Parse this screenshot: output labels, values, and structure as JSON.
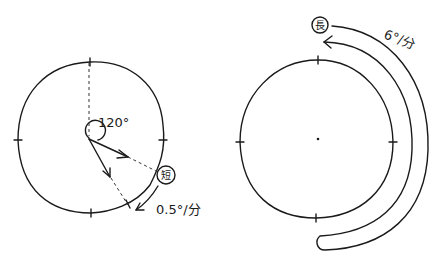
{
  "left_clock": {
    "angle_label": "120°",
    "hand_badge": "短",
    "speed_label": "0.5°/分"
  },
  "right_clock": {
    "hand_badge": "長",
    "speed_label": "6°/分"
  },
  "colors": {
    "ink": "#1a1a1a",
    "background": "#ffffff"
  }
}
